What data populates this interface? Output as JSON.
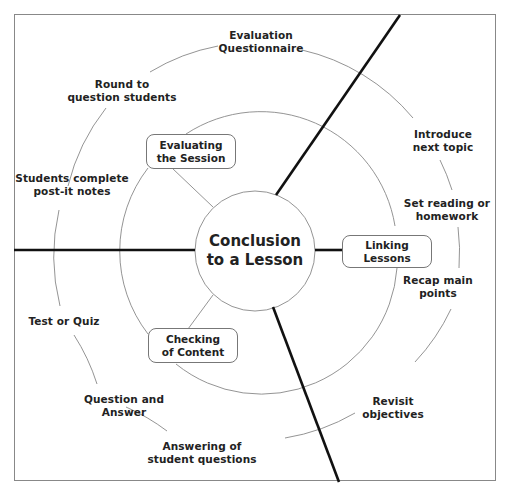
{
  "diagram": {
    "center": {
      "line1": "Conclusion",
      "line2": "to a Lesson"
    },
    "inner_boxes": [
      {
        "id": "evaluating",
        "line1": "Evaluating",
        "line2": "the Session"
      },
      {
        "id": "linking",
        "line1": "Linking",
        "line2": "Lessons"
      },
      {
        "id": "checking",
        "line1": "Checking",
        "line2": "of Content"
      }
    ],
    "outer_labels": [
      {
        "id": "evaluation-questionnaire",
        "line1": "Evaluation",
        "line2": "Questionnaire"
      },
      {
        "id": "round-to-question",
        "line1": "Round to",
        "line2": "question students"
      },
      {
        "id": "students-postit",
        "line1": "Students complete",
        "line2": "post-it notes"
      },
      {
        "id": "test-or-quiz",
        "line1": "Test or Quiz",
        "line2": ""
      },
      {
        "id": "question-and-answer",
        "line1": "Question and",
        "line2": "Answer"
      },
      {
        "id": "answering-student-questions",
        "line1": "Answering of",
        "line2": "student questions"
      },
      {
        "id": "revisit-objectives",
        "line1": "Revisit",
        "line2": "objectives"
      },
      {
        "id": "recap-main-points",
        "line1": "Recap main",
        "line2": "points"
      },
      {
        "id": "set-reading",
        "line1": "Set reading or",
        "line2": "homework"
      },
      {
        "id": "introduce-next-topic",
        "line1": "Introduce",
        "line2": "next topic"
      }
    ],
    "colors": {
      "thick_line": "#111111",
      "thin_line": "#888888",
      "frame": "#888888",
      "text": "#222222"
    }
  }
}
